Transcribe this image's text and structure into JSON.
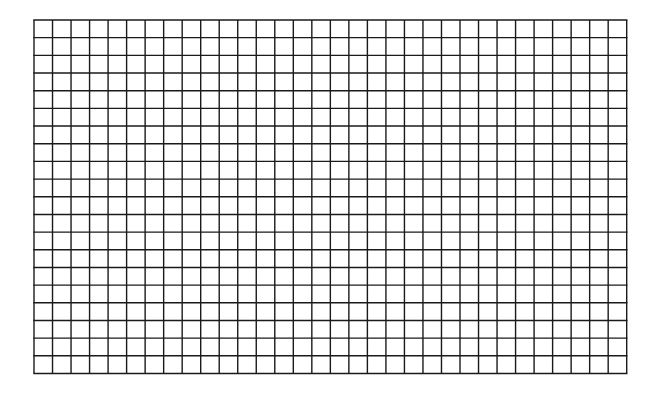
{
  "grid": {
    "columns": 32,
    "rows": 20,
    "left": 34,
    "top": 20,
    "right": 626.7,
    "bottom": 373.5,
    "line_color": "#1a1a1a",
    "line_width": 1.4,
    "background": "#ffffff"
  }
}
